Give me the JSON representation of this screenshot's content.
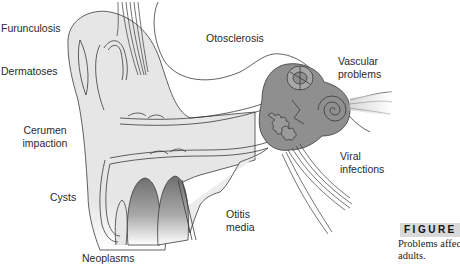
{
  "figure": {
    "label": "FIGURE",
    "caption_lines": [
      "Problems affecting the ear in",
      "adults."
    ]
  },
  "labels": {
    "furunculosis": "Furunculosis",
    "dermatoses": "Dermatoses",
    "cerumen_impaction_1": "Cerumen",
    "cerumen_impaction_2": "impaction",
    "cysts": "Cysts",
    "neoplasms": "Neoplasms",
    "otosclerosis": "Otosclerosis",
    "vascular_problems_1": "Vascular",
    "vascular_problems_2": "problems",
    "viral_infections_1": "Viral",
    "viral_infections_2": "infections",
    "otitis_media_1": "Otitis",
    "otitis_media_2": "media"
  },
  "colors": {
    "outer_ear_fill": "#e4e4e4",
    "inner_ear_fill": "#8f8f8f",
    "outline": "#3a3a3a",
    "figure_bar": "#d9d9d9"
  }
}
